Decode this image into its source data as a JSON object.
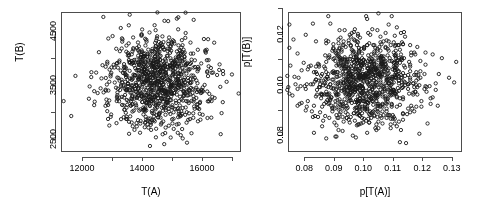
{
  "figure": {
    "background": "#ffffff",
    "foreground": "#4d4d4d",
    "point_color": "#1a1a1a",
    "panel_count": 2
  },
  "chart_data": [
    {
      "type": "scatter",
      "panel": "left",
      "title": "",
      "xlabel": "T(A)",
      "ylabel": "T(B)",
      "xlim": [
        11300,
        17300
      ],
      "ylim": [
        2250,
        4850
      ],
      "grid": false,
      "legend": null,
      "marker": "open-circle",
      "n_points": 1000,
      "xticks": [
        12000,
        13000,
        14000,
        15000,
        16000,
        17000
      ],
      "xticklabels": [
        "12000",
        "",
        "14000",
        "",
        "16000",
        ""
      ],
      "yticks": [
        2500,
        3000,
        3500,
        4000,
        4500
      ],
      "yticklabels": [
        "2500",
        "",
        "3500",
        "",
        "4500"
      ],
      "center": [
        14500,
        3550
      ],
      "spread": [
        820,
        430
      ],
      "correlation": 0.0
    },
    {
      "type": "scatter",
      "panel": "right",
      "title": "",
      "xlabel": "p[T(A)]",
      "ylabel": "p[T(B)]",
      "xlim": [
        0.0745,
        0.1335
      ],
      "ylim": [
        0.0735,
        0.1285
      ],
      "grid": false,
      "legend": null,
      "marker": "open-circle",
      "n_points": 1000,
      "xticks": [
        0.08,
        0.09,
        0.1,
        0.11,
        0.12,
        0.13
      ],
      "xticklabels": [
        "0.08",
        "0.09",
        "0.10",
        "0.11",
        "0.12",
        "0.13"
      ],
      "yticks": [
        0.08,
        0.09,
        0.1,
        0.11,
        0.12,
        0.13
      ],
      "yticklabels": [
        "0.08",
        "",
        "0.10",
        "",
        "0.12",
        ""
      ],
      "center": [
        0.1005,
        0.1012
      ],
      "spread": [
        0.0092,
        0.0088
      ],
      "correlation": 0.0,
      "quantized": true
    }
  ]
}
